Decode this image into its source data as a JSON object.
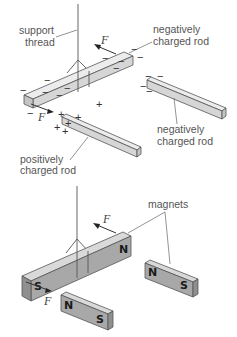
{
  "figure": {
    "top_panel": {
      "labels": {
        "support_thread_line1": "support",
        "support_thread_line2": "thread",
        "suspended_rod_line1": "negatively",
        "suspended_rod_line2": "charged rod",
        "right_rod_line1": "negatively",
        "right_rod_line2": "charged rod",
        "positive_rod_line1": "positively",
        "positive_rod_line2": "charged rod"
      },
      "force_label_top": "F",
      "force_label_bottom": "F",
      "negative_symbol": "−",
      "positive_symbol": "+"
    },
    "bottom_panel": {
      "labels": {
        "magnets": "magnets"
      },
      "force_label_top": "F",
      "force_label_bottom": "F",
      "suspended_magnet": {
        "far_pole": "N",
        "near_pole": "S"
      },
      "right_magnet": {
        "left_pole": "N",
        "right_pole": "S"
      },
      "front_magnet": {
        "left_pole": "N",
        "right_pole": "S"
      }
    },
    "colors": {
      "rod_top": "#ececec",
      "rod_side": "#d6d6d6",
      "magnet_side": "#a8a8a8",
      "text": "#555555"
    }
  }
}
